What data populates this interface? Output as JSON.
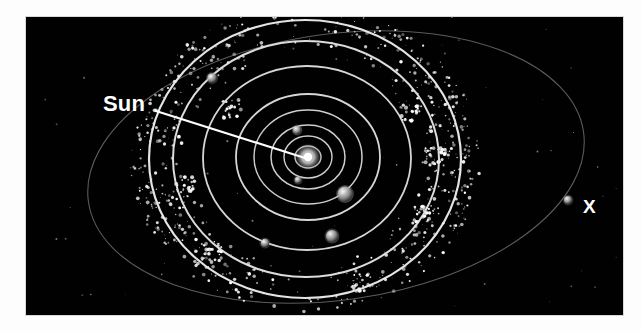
{
  "figure": {
    "background_color": "#ffffff",
    "panel_color": "#010101",
    "accent_color": "#ffffff",
    "orbit_color": "#d9d9d9",
    "faint_orbit_color": "#6a6a6a"
  },
  "labels": {
    "sun": "Sun",
    "planet_x": "X"
  },
  "icons": {
    "sun": "sun-icon",
    "leader": "leader-line-icon",
    "planet_x": "planet-x-icon",
    "belt": "asteroid-belt-icon"
  },
  "chart_data": {
    "type": "scatter",
    "title": "",
    "xlabel": "",
    "ylabel": "",
    "grid": false,
    "legend": "none",
    "center": {
      "cx": 282,
      "cy": 140,
      "name": "Sun"
    },
    "orbits": [
      {
        "name": "inner-orbit-1",
        "rx": 13,
        "ry": 11,
        "cx": 282,
        "cy": 140,
        "stroke": "#d9d9d9",
        "width": 1.4
      },
      {
        "name": "inner-orbit-2",
        "rx": 24,
        "ry": 21,
        "cx": 282,
        "cy": 140,
        "stroke": "#d9d9d9",
        "width": 1.4
      },
      {
        "name": "inner-orbit-3",
        "rx": 37,
        "ry": 32,
        "cx": 282,
        "cy": 140,
        "stroke": "#d9d9d9",
        "width": 1.5
      },
      {
        "name": "inner-orbit-4",
        "rx": 54,
        "ry": 47,
        "cx": 282,
        "cy": 140,
        "stroke": "#d9d9d9",
        "width": 1.5
      },
      {
        "name": "orbit-jupiter",
        "rx": 72,
        "ry": 63,
        "cx": 282,
        "cy": 140,
        "stroke": "#e2e2e2",
        "width": 1.8
      },
      {
        "name": "orbit-saturn",
        "rx": 104,
        "ry": 92,
        "cx": 281,
        "cy": 141,
        "stroke": "#e2e2e2",
        "width": 1.8
      },
      {
        "name": "orbit-uranus",
        "rx": 133,
        "ry": 118,
        "cx": 280,
        "cy": 142,
        "stroke": "#e8e8e8",
        "width": 2.0
      },
      {
        "name": "orbit-neptune",
        "rx": 156,
        "ry": 139,
        "cx": 279,
        "cy": 142,
        "stroke": "#f0f0f0",
        "width": 2.2
      }
    ],
    "eccentric_orbit": {
      "name": "planet-x-orbit",
      "rx": 250,
      "ry": 133,
      "cx": 310,
      "cy": 150,
      "rotation": -8,
      "stroke": "#7a7a7a",
      "width": 1.1
    },
    "planets": [
      {
        "name": "planet-inner-a",
        "x": 271,
        "y": 113,
        "r": 4.0,
        "color": "#cfcfcf"
      },
      {
        "name": "planet-inner-b",
        "x": 272,
        "y": 163,
        "r": 3.2,
        "color": "#b5b5b5"
      },
      {
        "name": "planet-jupiter",
        "x": 319,
        "y": 177,
        "r": 7.5,
        "color": "#e6e6e6"
      },
      {
        "name": "planet-saturn",
        "x": 306,
        "y": 219,
        "r": 6.0,
        "color": "#c2c2c2"
      },
      {
        "name": "planet-uranus",
        "x": 239,
        "y": 226,
        "r": 4.2,
        "color": "#9a9a9a"
      },
      {
        "name": "planet-neptune",
        "x": 186,
        "y": 61,
        "r": 4.8,
        "color": "#8f8f8f"
      },
      {
        "name": "planet-x",
        "x": 542,
        "y": 183,
        "r": 4.0,
        "color": "#9c9c9c"
      }
    ],
    "leader_line": {
      "x1": 130,
      "y1": 94,
      "x2": 279,
      "y2": 141
    },
    "belt": {
      "description": "Kuiper-belt / asteroid swarm concentrated between the two outermost bright orbits",
      "inner_rx": 116,
      "inner_ry": 102,
      "outer_rx": 175,
      "outer_ry": 155,
      "cx": 279,
      "cy": 141,
      "count": 900,
      "color": "#ffffff"
    },
    "field_stars": {
      "count": 60,
      "color": "#cfcfcf"
    }
  }
}
